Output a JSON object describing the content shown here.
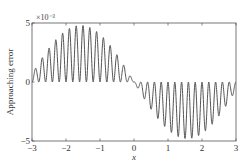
{
  "chart_data": {
    "type": "line",
    "title": "",
    "xlabel": "x",
    "ylabel": "Approaching error",
    "y_scale_label": "×10⁻³",
    "xlim": [
      -3,
      3
    ],
    "ylim": [
      -5,
      5
    ],
    "y_multiplier": 0.001,
    "xticks": [
      -3,
      -2,
      -1,
      0,
      1,
      2,
      3
    ],
    "xtick_labels": [
      "−3",
      "−2",
      "−1",
      "0",
      "1",
      "2",
      "3"
    ],
    "yticks": [
      -5,
      0,
      5
    ],
    "ytick_labels": [
      "−5",
      "0",
      "5"
    ],
    "grid": false,
    "legend": null,
    "series": [
      {
        "name": "approaching error",
        "color": "#555555",
        "description": "oscillating error ≈ -4.8e-3·sin(x)·(0.5−0.5·cos(10πx)), ~15 ripples per half-range, envelope peak ≈ +4.8e-3 near x≈-1.6 and ≈ -4.8e-3 near x≈1.6",
        "envelope_amplitude": 4.8,
        "ripple_frequency": 5,
        "x": [
          -3.0,
          -2.5,
          -2.0,
          -1.6,
          -1.0,
          -0.5,
          0.0,
          0.5,
          1.0,
          1.6,
          2.0,
          2.5,
          3.0
        ],
        "envelope": [
          0.68,
          2.87,
          4.36,
          4.8,
          4.04,
          2.3,
          0.0,
          -2.3,
          -4.04,
          -4.8,
          -4.36,
          -2.87,
          -0.68
        ]
      }
    ]
  }
}
